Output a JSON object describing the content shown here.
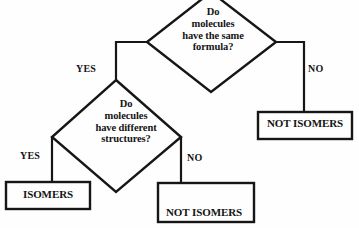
{
  "diagram": {
    "type": "flowchart",
    "background_color": "#fefefe",
    "stroke_color": "#161616",
    "text_color": "#141414",
    "nodes": [
      {
        "id": "q1",
        "shape": "diamond",
        "text": "Do\nmolecules\nhave the same\nformula?"
      },
      {
        "id": "q2",
        "shape": "diamond",
        "text": "Do\nmolecules\nhave different\nstructures?"
      },
      {
        "id": "not_isomers_right",
        "shape": "rectangle",
        "text": "NOT ISOMERS"
      },
      {
        "id": "isomers",
        "shape": "rectangle",
        "text": "ISOMERS"
      },
      {
        "id": "not_isomers_same_molecule",
        "shape": "rectangle",
        "line1": "NOT ISOMERS",
        "line2": "same molecule"
      }
    ],
    "edge_labels": {
      "q1_yes": "YES",
      "q1_no": "NO",
      "q2_yes": "YES",
      "q2_no": "NO"
    }
  }
}
